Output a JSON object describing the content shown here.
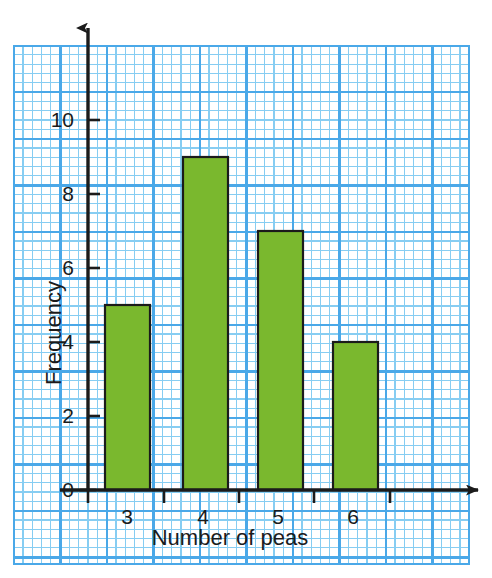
{
  "chart_data": {
    "type": "bar",
    "title": "",
    "subtitle": "",
    "xlabel": "Number of peas",
    "ylabel": "Frequency",
    "categories": [
      "3",
      "4",
      "5",
      "6"
    ],
    "values": [
      5,
      9,
      7,
      4
    ],
    "series": [
      {
        "name": "Frequency",
        "values": [
          5,
          9,
          7,
          4
        ]
      }
    ],
    "ylim": [
      0,
      11
    ],
    "xlim": [
      2.5,
      7.0
    ],
    "y_ticks": [
      "0",
      "2",
      "4",
      "6",
      "8",
      "10"
    ],
    "y_tick_values": [
      0,
      2,
      4,
      6,
      8,
      10
    ],
    "x_ticks": [
      "3",
      "4",
      "5",
      "6"
    ],
    "grid": "graph-paper",
    "legend": "none",
    "bar_color": "#7ab82e",
    "bar_edge_color": "#1b1b1b",
    "grid_major_color": "#4aa8e8",
    "grid_minor_color": "#86cdf2",
    "axis_color": "#1b1b1b",
    "background_color": "#ffffff",
    "annotations": []
  },
  "axes": {
    "y_axis_label": "Frequency",
    "x_axis_label": "Number of peas",
    "y_tick_labels": [
      "0",
      "2",
      "4",
      "6",
      "8",
      "10"
    ],
    "x_tick_labels": [
      "3",
      "4",
      "5",
      "6"
    ],
    "y_arrow": "up-arrow-icon",
    "x_arrow": "right-arrow-icon"
  },
  "bars": [
    {
      "label": "3",
      "value": 5,
      "value_text": "5"
    },
    {
      "label": "4",
      "value": 9,
      "value_text": "9"
    },
    {
      "label": "5",
      "value": 7,
      "value_text": "7"
    },
    {
      "label": "6",
      "value": 4,
      "value_text": "4"
    }
  ]
}
